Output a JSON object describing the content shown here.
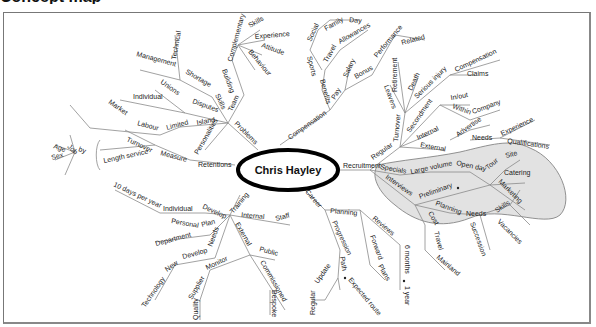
{
  "title": "Concept map",
  "center_node": "Chris Hayley",
  "colors": {
    "line": "#8a8a8a",
    "highlight_fill": "#e2e2e2",
    "highlight_stroke": "#777777",
    "center_border": "#000000"
  },
  "branches": {
    "problems": {
      "label": "Problems",
      "team": "Team",
      "building": "Building",
      "complementary": "Complementary",
      "comp_children": [
        "Skills",
        "Experience",
        "Attitude",
        "Behaviour"
      ],
      "skills": "Skills",
      "shortage": "Shortage",
      "shortage_children": [
        "Management",
        "Technical"
      ],
      "disputes": "Disputes",
      "disputes_children": [
        "Unions",
        "Individual"
      ],
      "island": "Island",
      "limited": "Limited",
      "labour": "Labour",
      "market": "Market",
      "personalities": "Personalities"
    },
    "compensation": {
      "label": "Compensation",
      "benefits": "Benefits",
      "sports": "Sports",
      "social": "Social",
      "family": "Family",
      "day": "Day",
      "travel": "Travel",
      "allowances": "Allowances",
      "pay": "Pay",
      "salary": "Salary",
      "bonus": "Bonus",
      "performance": "Performance",
      "related": "Related"
    },
    "recruitment": {
      "label": "Recruitment",
      "regular": "Regular",
      "turnover": "Turnover",
      "turnover_children": [
        "Leavers",
        "Retirement",
        "Death"
      ],
      "serious_injury": "Serious injury",
      "serious_children": [
        "Compensation",
        "Claims"
      ],
      "secondment": "Secondment",
      "in_out": "In/out",
      "within": "Within",
      "company": "Company",
      "internal": "Internal",
      "external": "External",
      "advertise": "Advertise",
      "needs": "Needs",
      "needs_children": [
        "Experience",
        "Qualifications"
      ],
      "specials": "Specials",
      "large_volume": "Large volume",
      "open_day": "Open day",
      "tour": "Tour",
      "site": "Site",
      "catering": "Catering",
      "marketing": "Marketing",
      "interviews": "Interviews",
      "preliminary": "Preliminary",
      "planning": "Planning",
      "planning_needs": "Needs",
      "planning_needs_children": [
        "Skills",
        "Vacancies"
      ],
      "succession": "Succession",
      "cost": "Cost",
      "travel": "Travel",
      "mainland": "Mainland"
    },
    "career": {
      "label": "Career",
      "planning": "Planning",
      "reviews": "Reviews",
      "six_months": "6 months",
      "one_year": "1 year",
      "forward": "Forward",
      "plans": "Plans",
      "progression": "Progression",
      "path": "Path",
      "expected_route": "Expected route",
      "update": "Update",
      "regular": "Regular"
    },
    "training": {
      "label": "Training",
      "develop": "Develop",
      "individual": "Individual",
      "ten_days": "10 days per year",
      "internal": "Internal",
      "staff": "Staff",
      "plan": "Plan",
      "personal": "Personal",
      "department": "Department",
      "needs": "Needs",
      "develop2": "Develop",
      "new": "New",
      "technology": "Technology",
      "external": "External",
      "public": "Public",
      "commissioned": "Commissioned",
      "bespoke": "Bespoke",
      "monitor": "Monitor",
      "supplier": "Supplier",
      "quality": "Quality"
    },
    "retentions": {
      "label": "Retentions",
      "measure": "Measure",
      "turnover": "Turnover",
      "length_service": "Length service",
      "by": "by",
      "by_children": [
        "Job",
        "Age",
        "Sex"
      ]
    }
  }
}
